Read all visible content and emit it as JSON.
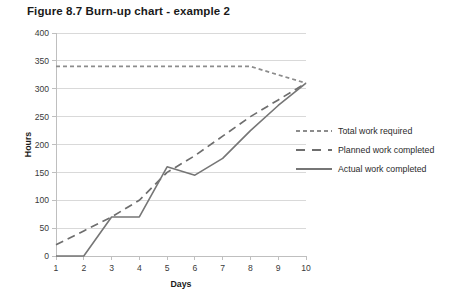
{
  "figure": {
    "title": "Figure 8.7  Burn-up chart - example 2"
  },
  "chart_data": {
    "type": "line",
    "title": "Figure 8.7  Burn-up chart - example 2",
    "xlabel": "Days",
    "ylabel": "Hours",
    "x": [
      1,
      2,
      3,
      4,
      5,
      6,
      7,
      8,
      9,
      10
    ],
    "xtick_labels": [
      "1",
      "2",
      "3",
      "4",
      "5",
      "6",
      "7",
      "8",
      "9",
      "10"
    ],
    "ytick_labels": [
      "0",
      "50",
      "100",
      "150",
      "200",
      "250",
      "300",
      "350",
      "400"
    ],
    "yticks": [
      0,
      50,
      100,
      150,
      200,
      250,
      300,
      350,
      400
    ],
    "xlim": [
      1,
      10
    ],
    "ylim": [
      0,
      400
    ],
    "grid": "horizontal",
    "legend_position": "right",
    "series": [
      {
        "name": "Total work required",
        "style": "dotted",
        "color": "#8c8c8c",
        "values": [
          340,
          340,
          340,
          340,
          340,
          340,
          340,
          340,
          325,
          310
        ]
      },
      {
        "name": "Planned work completed",
        "style": "dashed",
        "color": "#6e6e6e",
        "values": [
          20,
          45,
          70,
          100,
          150,
          180,
          215,
          250,
          280,
          310
        ]
      },
      {
        "name": "Actual work completed",
        "style": "solid",
        "color": "#767676",
        "values": [
          0,
          0,
          70,
          70,
          160,
          145,
          175,
          225,
          270,
          310
        ]
      }
    ]
  },
  "legend": {
    "items": [
      {
        "label": "Total work required"
      },
      {
        "label": "Planned work completed"
      },
      {
        "label": "Actual work completed"
      }
    ]
  },
  "colors": {
    "gridline": "#d9d9d9",
    "axis": "#bfbfbf",
    "text": "#231f20"
  }
}
